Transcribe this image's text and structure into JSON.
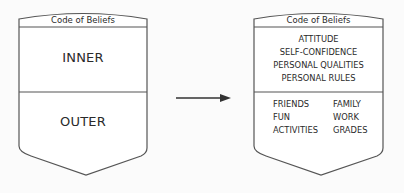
{
  "left_shield": {
    "header": "Code of Beliefs",
    "top_label": "INNER",
    "bottom_label": "OUTER"
  },
  "arrow": {
    "direction": "right"
  },
  "right_shield": {
    "header": "Code of Beliefs",
    "inner_items": [
      "ATTITUDE",
      "SELF-CONFIDENCE",
      "PERSONAL QUALITIES",
      "PERSONAL RULES"
    ],
    "outer_left": [
      "FRIENDS",
      "FUN",
      "ACTIVITIES"
    ],
    "outer_right": [
      "FAMILY",
      "WORK",
      "GRADES"
    ]
  }
}
